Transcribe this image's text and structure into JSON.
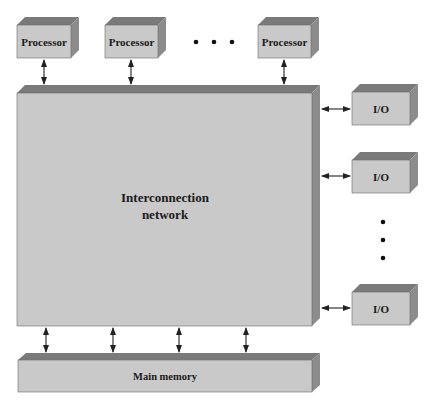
{
  "diagram": {
    "colors": {
      "front": "#c9c9c9",
      "top": "#7a7a7a",
      "side": "#8c8c8c",
      "edge": "#5a5a5a",
      "arrow": "#222222",
      "dot": "#111111"
    },
    "processors": [
      {
        "label": "Processor"
      },
      {
        "label": "Processor"
      },
      {
        "label": "Processor"
      }
    ],
    "processor_ellipsis": "• • •",
    "network": {
      "line1": "Interconnection",
      "line2": "network"
    },
    "io_devices": [
      {
        "label": "I/O"
      },
      {
        "label": "I/O"
      },
      {
        "label": "I/O"
      }
    ],
    "io_ellipsis": "vertical-dots",
    "memory": {
      "label": "Main memory"
    }
  }
}
